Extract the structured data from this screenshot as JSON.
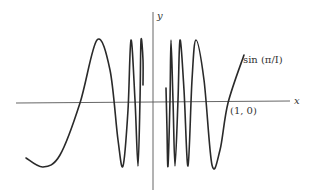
{
  "chart_data": {
    "type": "line",
    "title": "",
    "function_label": "sin (π/I)",
    "xlabel": "x",
    "ylabel": "y",
    "annotations": [
      {
        "text": "(1, 0)",
        "x": 1,
        "y": 0
      }
    ],
    "grid": false,
    "legend": null,
    "series": [
      {
        "name": "sin (π/I)",
        "description": "Curve oscillating with increasing frequency as it approaches the y-axis from both sides; crosses x-axis at (1, 0).",
        "pixel_path_left": [
          [
            26,
            158
          ],
          [
            43,
            167
          ],
          [
            60,
            155
          ],
          [
            80,
            103
          ],
          [
            97,
            40
          ],
          [
            110,
            70
          ],
          [
            118,
            140
          ],
          [
            123,
            166
          ],
          [
            128,
            110
          ],
          [
            131,
            40
          ],
          [
            135,
            100
          ],
          [
            138,
            166
          ],
          [
            140,
            100
          ],
          [
            141,
            40
          ],
          [
            143,
            60
          ],
          [
            143,
            85
          ]
        ],
        "pixel_path_right": [
          [
            166,
            88
          ],
          [
            167,
            130
          ],
          [
            168,
            166
          ],
          [
            170,
            100
          ],
          [
            171,
            40
          ],
          [
            173,
            100
          ],
          [
            175,
            166
          ],
          [
            178,
            100
          ],
          [
            180,
            40
          ],
          [
            184,
            90
          ],
          [
            188,
            166
          ],
          [
            192,
            80
          ],
          [
            196,
            40
          ],
          [
            204,
            80
          ],
          [
            212,
            165
          ],
          [
            220,
            150
          ],
          [
            228,
            103
          ],
          [
            244,
            55
          ]
        ]
      }
    ]
  },
  "labels": {
    "y_axis": "y",
    "x_axis": "x",
    "point": "(1, 0)",
    "function": "sin (π/I)"
  }
}
